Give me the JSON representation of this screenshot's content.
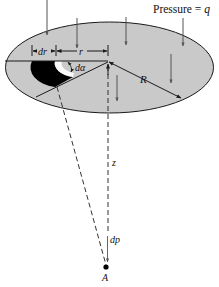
{
  "diagram": {
    "title": "Pressure = q",
    "title_prefix": "Pressure = ",
    "title_var": "q",
    "labels": {
      "dr": "dr",
      "r": "r",
      "d_alpha": "dα",
      "R": "R",
      "z": "z",
      "dp": "dp",
      "A": "A"
    },
    "colors": {
      "plate_fill": "#c9c9c9",
      "element_fill": "#000000",
      "stroke": "#1a1a1a",
      "arrow": "#555555"
    }
  }
}
